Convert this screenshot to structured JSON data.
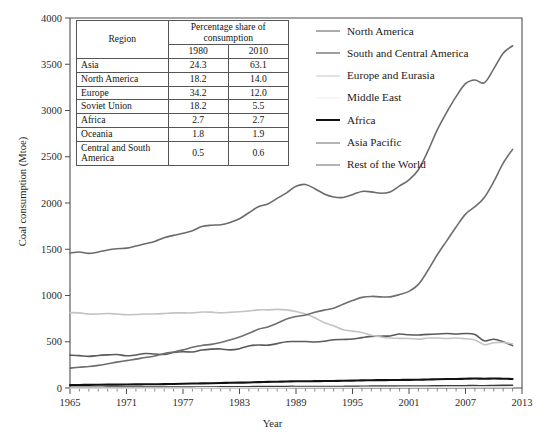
{
  "chart_data": {
    "type": "line",
    "title": "",
    "xlabel": "Year",
    "ylabel": "Coal consumption (Mtoe)",
    "xlim": [
      1965,
      2013
    ],
    "ylim": [
      0,
      4000
    ],
    "xticks": [
      1965,
      1971,
      1977,
      1983,
      1989,
      1995,
      2001,
      2007,
      2013
    ],
    "yticks": [
      0,
      500,
      1000,
      1500,
      2000,
      2500,
      3000,
      3500,
      4000
    ],
    "grid": false,
    "legend_position": "top-right",
    "x": [
      1965,
      1966,
      1967,
      1968,
      1969,
      1970,
      1971,
      1972,
      1973,
      1974,
      1975,
      1976,
      1977,
      1978,
      1979,
      1980,
      1981,
      1982,
      1983,
      1984,
      1985,
      1986,
      1987,
      1988,
      1989,
      1990,
      1991,
      1992,
      1993,
      1994,
      1995,
      1996,
      1997,
      1998,
      1999,
      2000,
      2001,
      2002,
      2003,
      2004,
      2005,
      2006,
      2007,
      2008,
      2009,
      2010,
      2011,
      2012
    ],
    "series": [
      {
        "name": "North America",
        "color": "#5a5a5a",
        "width": 1.6,
        "values": [
          355,
          350,
          342,
          352,
          358,
          362,
          348,
          357,
          373,
          368,
          363,
          383,
          392,
          390,
          410,
          420,
          422,
          412,
          425,
          455,
          465,
          463,
          480,
          500,
          502,
          503,
          497,
          505,
          522,
          525,
          530,
          545,
          558,
          560,
          563,
          583,
          575,
          573,
          580,
          583,
          590,
          583,
          590,
          578,
          510,
          527,
          500,
          458
        ]
      },
      {
        "name": "South and Central America",
        "color": "#3d3d3d",
        "width": 1.6,
        "values": [
          8,
          8,
          8,
          8,
          9,
          9,
          9,
          9,
          9,
          9,
          10,
          10,
          10,
          10,
          11,
          11,
          12,
          12,
          13,
          14,
          15,
          15,
          16,
          17,
          17,
          16,
          16,
          16,
          16,
          17,
          18,
          19,
          20,
          20,
          20,
          21,
          21,
          21,
          22,
          23,
          24,
          24,
          25,
          26,
          24,
          26,
          28,
          30
        ]
      },
      {
        "name": "Europe and Eurasia",
        "color": "#c3c3c3",
        "width": 1.6,
        "values": [
          815,
          812,
          800,
          800,
          805,
          800,
          792,
          795,
          800,
          800,
          805,
          812,
          812,
          812,
          822,
          820,
          812,
          818,
          825,
          832,
          845,
          845,
          850,
          845,
          828,
          800,
          760,
          705,
          672,
          630,
          615,
          600,
          570,
          552,
          540,
          537,
          535,
          528,
          540,
          540,
          535,
          540,
          532,
          520,
          468,
          490,
          492,
          478
        ]
      },
      {
        "name": "Middle East",
        "color": "#e8e8e8",
        "width": 1.5,
        "values": [
          1,
          1,
          1,
          1,
          1,
          1,
          1,
          1,
          1,
          1,
          1,
          1,
          1,
          1,
          2,
          2,
          2,
          2,
          2,
          3,
          3,
          3,
          4,
          4,
          5,
          5,
          5,
          5,
          6,
          6,
          6,
          7,
          7,
          7,
          8,
          8,
          8,
          8,
          9,
          9,
          9,
          9,
          9,
          10,
          10,
          10,
          11,
          11
        ]
      },
      {
        "name": "Africa",
        "color": "#111111",
        "width": 2.1,
        "values": [
          32,
          33,
          34,
          35,
          36,
          37,
          38,
          39,
          40,
          41,
          42,
          44,
          46,
          48,
          50,
          52,
          54,
          56,
          58,
          60,
          64,
          66,
          68,
          70,
          73,
          73,
          74,
          75,
          76,
          78,
          80,
          82,
          84,
          85,
          86,
          87,
          88,
          90,
          92,
          95,
          97,
          98,
          100,
          102,
          100,
          102,
          100,
          98
        ]
      },
      {
        "name": "Asia Pacific",
        "color": "#6e6e6e",
        "width": 1.6,
        "values": [
          215,
          225,
          232,
          245,
          262,
          280,
          296,
          312,
          330,
          345,
          372,
          390,
          412,
          440,
          460,
          472,
          492,
          520,
          552,
          592,
          635,
          660,
          700,
          745,
          772,
          790,
          818,
          842,
          862,
          905,
          945,
          980,
          990,
          985,
          985,
          1010,
          1045,
          1120,
          1270,
          1440,
          1590,
          1740,
          1880,
          1960,
          2060,
          2230,
          2430,
          2580
        ]
      },
      {
        "name": "Rest of the World",
        "color": "#6b6b6b",
        "width": 1.6,
        "values": [
          1460,
          1470,
          1455,
          1470,
          1492,
          1505,
          1512,
          1535,
          1560,
          1585,
          1625,
          1650,
          1672,
          1700,
          1745,
          1760,
          1765,
          1790,
          1830,
          1895,
          1960,
          1990,
          2050,
          2110,
          2180,
          2200,
          2155,
          2098,
          2065,
          2060,
          2090,
          2125,
          2120,
          2105,
          2120,
          2185,
          2250,
          2360,
          2560,
          2790,
          2980,
          3150,
          3290,
          3330,
          3300,
          3450,
          3620,
          3700
        ]
      }
    ]
  },
  "table": {
    "header": {
      "region": "Region",
      "span": "Percentage share of consumption",
      "years": [
        "1980",
        "2010"
      ]
    },
    "rows": [
      {
        "region": "Asia",
        "v1980": "24.3",
        "v2010": "63.1"
      },
      {
        "region": "North America",
        "v1980": "18.2",
        "v2010": "14.0"
      },
      {
        "region": "Europe",
        "v1980": "34.2",
        "v2010": "12.0"
      },
      {
        "region": "Soviet Union",
        "v1980": "18.2",
        "v2010": "5.5"
      },
      {
        "region": "Africa",
        "v1980": "2.7",
        "v2010": "2.7"
      },
      {
        "region": "Oceania",
        "v1980": "1.8",
        "v2010": "1.9"
      },
      {
        "region": "Central and South America",
        "v1980": "0.5",
        "v2010": "0.6"
      }
    ]
  },
  "legend": {
    "items": [
      {
        "label": "North America",
        "color": "#5a5a5a",
        "width": "1.6px"
      },
      {
        "label": "South and Central America",
        "color": "#3d3d3d",
        "width": "1.8px"
      },
      {
        "label": "Europe and Eurasia",
        "color": "#c8c8c8",
        "width": "1.6px"
      },
      {
        "label": "Middle East",
        "color": "#ededed",
        "width": "1.5px"
      },
      {
        "label": "Africa",
        "color": "#111111",
        "width": "2.4px"
      },
      {
        "label": "Asia Pacific",
        "color": "#6e6e6e",
        "width": "1.6px"
      },
      {
        "label": "Rest of the World",
        "color": "#6b6b6b",
        "width": "1.6px"
      }
    ]
  }
}
